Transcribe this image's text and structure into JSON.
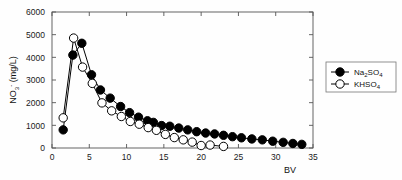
{
  "chart_data": {
    "type": "line",
    "title": "",
    "subtitle": "",
    "xlabel": "BV",
    "ylabel": "NO3- (mg/L)",
    "ylabel_parts": {
      "base": "NO",
      "sub": "3",
      "sup": "-",
      "unit": " (mg/L)"
    },
    "xlim": [
      0,
      35
    ],
    "ylim": [
      0,
      6000
    ],
    "xticks": [
      0,
      5,
      10,
      15,
      20,
      25,
      30,
      35
    ],
    "xtick_labels": [
      "0",
      "5",
      "10",
      "15",
      "20",
      "25",
      "30",
      "35"
    ],
    "yticks": [
      0,
      1000,
      2000,
      3000,
      4000,
      5000,
      6000
    ],
    "ytick_labels": [
      "0",
      "1000",
      "2000",
      "3000",
      "4000",
      "5000",
      "6000"
    ],
    "grid": false,
    "legend_position": "right-outside",
    "marker_size": 4.2,
    "line_color": "#000000",
    "frame_color": "#555555",
    "series": [
      {
        "name": "Na2SO4",
        "label_parts": {
          "a": "Na",
          "b": "2",
          "c": "SO",
          "d": "4"
        },
        "marker": "filled-circle",
        "color": "#000000",
        "fill": "#000000",
        "x": [
          1.5,
          2.8,
          4.0,
          5.3,
          6.5,
          7.8,
          9.2,
          10.4,
          11.6,
          12.8,
          13.6,
          14.7,
          15.8,
          17.0,
          18.2,
          19.4,
          20.6,
          21.8,
          23.0,
          24.2,
          25.4,
          26.8,
          28.2,
          29.6,
          31.0,
          32.3,
          33.5
        ],
        "y": [
          800,
          4100,
          4620,
          3230,
          2560,
          2200,
          1830,
          1560,
          1360,
          1200,
          1130,
          990,
          960,
          880,
          800,
          720,
          660,
          620,
          560,
          500,
          450,
          400,
          360,
          300,
          250,
          200,
          160
        ]
      },
      {
        "name": "KHSO4",
        "label_parts": {
          "a": "KHSO",
          "b": "4"
        },
        "marker": "open-circle",
        "color": "#000000",
        "fill": "#ffffff",
        "x": [
          1.5,
          2.9,
          4.1,
          5.4,
          6.7,
          8.0,
          9.3,
          10.5,
          11.7,
          12.9,
          14.0,
          15.2,
          16.4,
          17.6,
          18.8,
          20.0,
          21.2,
          23.0
        ],
        "y": [
          1330,
          4850,
          3570,
          2850,
          1990,
          1640,
          1390,
          1170,
          1050,
          900,
          780,
          600,
          460,
          360,
          260,
          110,
          130,
          70
        ]
      }
    ]
  },
  "legend": {
    "items": [
      {
        "series": "Na2SO4",
        "marker": "filled-circle"
      },
      {
        "series": "KHSO4",
        "marker": "open-circle"
      }
    ]
  }
}
